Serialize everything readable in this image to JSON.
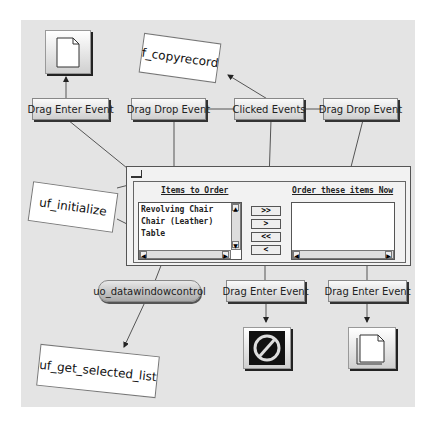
{
  "events": {
    "drag_enter_top_left": "Drag Enter Event",
    "drag_drop_left": "Drag Drop Event",
    "clicked": "Clicked Events",
    "drag_drop_right": "Drag Drop Event",
    "drag_enter_bottom_mid": "Drag Enter Event",
    "drag_enter_bottom_right": "Drag Enter Event"
  },
  "functions": {
    "copyrecord": "f_copyrecord",
    "initialize": "uf_initialize",
    "get_selected_list": "uf_get_selected_list"
  },
  "control": {
    "label": "uo_datawindowcontrol"
  },
  "window": {
    "left_title": "Items to Order",
    "right_title": "Order these items Now",
    "items": [
      "Revolving Chair",
      "Chair (Leather)",
      "Table"
    ],
    "buttons": {
      "add_all": ">>",
      "add": ">",
      "remove_all": "<<",
      "remove": "<"
    }
  },
  "icons": {
    "top_left": "document-icon",
    "bottom_mid": "no-drop-icon",
    "bottom_right": "multi-document-icon"
  },
  "colors": {
    "background": "#e4e4e4",
    "lines": "#555555"
  }
}
